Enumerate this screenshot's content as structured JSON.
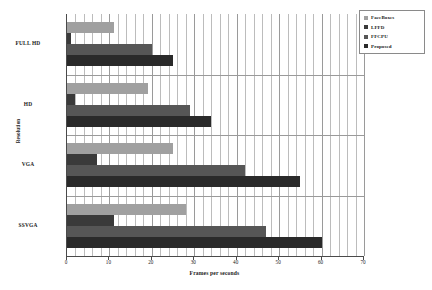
{
  "chart_data": {
    "type": "bar",
    "orientation": "horizontal",
    "title": "",
    "xlabel": "Frames per seconds",
    "ylabel": "Resolution",
    "categories": [
      "FULL HD",
      "HD",
      "VGA",
      "SSVGA"
    ],
    "series": [
      {
        "name": "FaceBoxes",
        "color": "#a0a0a0",
        "values": [
          11,
          19,
          25,
          28
        ]
      },
      {
        "name": "LFFD",
        "color": "#3a3a3a",
        "values": [
          1,
          2,
          7,
          11
        ]
      },
      {
        "name": "FFCPU",
        "color": "#565656",
        "values": [
          20,
          29,
          42,
          47
        ]
      },
      {
        "name": "Proposed",
        "color": "#2a2a2a",
        "values": [
          25,
          34,
          55,
          60
        ]
      }
    ],
    "xlim": [
      0,
      70
    ],
    "xticks": [
      0,
      10,
      20,
      30,
      40,
      50,
      60,
      70
    ],
    "xtick_labels": [
      "0",
      "10",
      "20",
      "30",
      "40",
      "50",
      "60",
      "70"
    ],
    "minor_gridlines_per_major": 5,
    "grid": true,
    "grid_axis": "x",
    "legend_position": "top-right",
    "legend_boxed": true
  }
}
